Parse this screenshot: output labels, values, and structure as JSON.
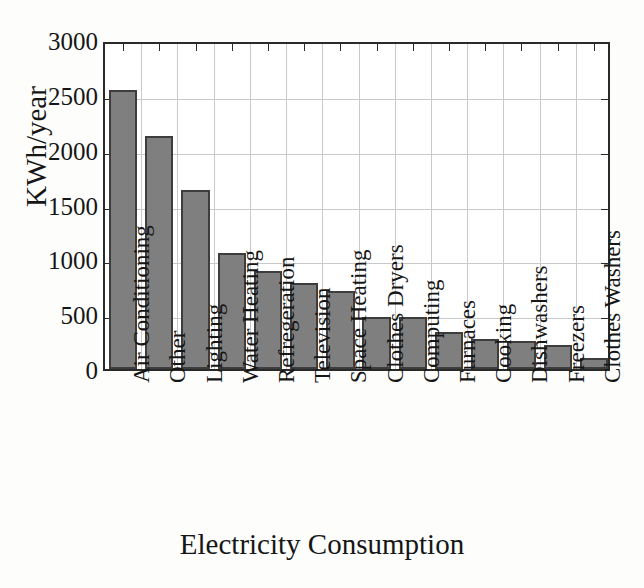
{
  "chart_data": {
    "type": "bar",
    "title": "",
    "xlabel": "Electricity Consumption",
    "ylabel": "KWh/year",
    "ylim": [
      0,
      3000
    ],
    "ytick_labels": [
      "0",
      "500",
      "1000",
      "1500",
      "2000",
      "2500",
      "3000"
    ],
    "ytick_values": [
      0,
      500,
      1000,
      1500,
      2000,
      2500,
      3000
    ],
    "grid": true,
    "legend": null,
    "bar_color": "#7f7f7f",
    "bar_edge_color": "#3d3d3d",
    "axis_color": "#2a2a2a",
    "grid_color": "#c9c9c9",
    "categories": [
      "Air Conditioning",
      "Other",
      "Lighting",
      "Water Heating",
      "Refregeration",
      "Television",
      "Space Heating",
      "Clothes Dryers",
      "Computing",
      "Furnaces",
      "Cooking",
      "Dishwashers",
      "Freezers",
      "Clothes Washers"
    ],
    "values": [
      2545,
      2125,
      1630,
      1060,
      890,
      780,
      715,
      475,
      470,
      340,
      275,
      260,
      220,
      105
    ]
  }
}
